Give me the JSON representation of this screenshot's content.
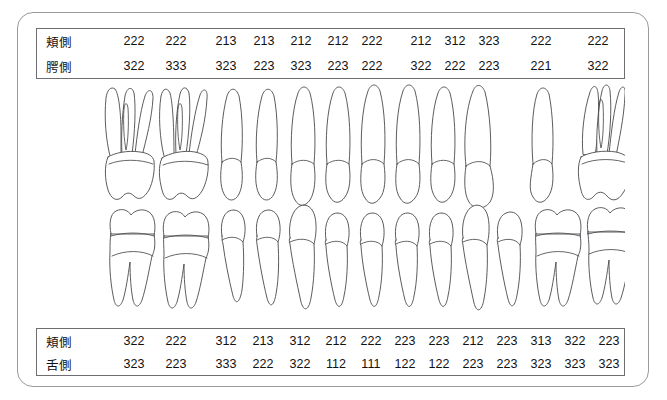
{
  "form": {
    "title": "periodontal-pocket-chart"
  },
  "upper_table": {
    "rows": [
      {
        "label": "頬側",
        "values": [
          "222",
          "222",
          "213",
          "213",
          "212",
          "212",
          "222",
          "212",
          "312",
          "323",
          "222",
          "222"
        ]
      },
      {
        "label": "腭側",
        "values": [
          "322",
          "333",
          "323",
          "223",
          "323",
          "223",
          "222",
          "322",
          "222",
          "223",
          "221",
          "322"
        ]
      }
    ],
    "positions": [
      133,
      175,
      225,
      263,
      300,
      337,
      371,
      420,
      454,
      488,
      540,
      597
    ]
  },
  "lower_table": {
    "rows": [
      {
        "label": "頬側",
        "values": [
          "322",
          "222",
          "312",
          "213",
          "312",
          "212",
          "222",
          "223",
          "223",
          "212",
          "223",
          "313",
          "322",
          "223"
        ]
      },
      {
        "label": "舌側",
        "values": [
          "323",
          "223",
          "333",
          "222",
          "322",
          "112",
          "111",
          "122",
          "122",
          "223",
          "223",
          "323",
          "323",
          "323"
        ]
      }
    ],
    "positions": [
      133,
      175,
      225,
      262,
      299,
      335,
      370,
      404,
      438,
      472,
      506,
      540,
      574,
      608
    ]
  },
  "colors": {
    "frame_stroke": "#9a9a9e",
    "table_stroke": "#6e6e72",
    "tooth_stroke": "#4a4a4e",
    "text": "#111111",
    "background": "#ffffff"
  },
  "teeth": {
    "upper_arch_label": "upper-arch-teeth",
    "lower_arch_label": "lower-arch-teeth",
    "upper_count": 12,
    "lower_count": 14
  }
}
